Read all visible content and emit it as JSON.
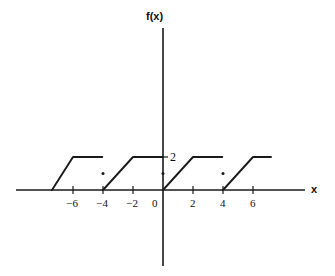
{
  "figure": {
    "background_color": "#ffffff",
    "ink_color": "#1a1a1a"
  },
  "axes": {
    "x_axis_label": "x",
    "y_axis_label": "f(x)",
    "y_value_label": "2",
    "x_tick_labels": [
      "−6",
      "−4",
      "−2",
      "0",
      "2",
      "4",
      "6"
    ],
    "x_tick_values": [
      -6,
      -4,
      -2,
      0,
      2,
      4,
      6
    ],
    "origin_label": "0"
  },
  "chart_data": {
    "type": "line",
    "title": "",
    "xlabel": "x",
    "ylabel": "f(x)",
    "xlim": [
      -7.6,
      7.8
    ],
    "ylim": [
      -1.4,
      5.4
    ],
    "grid": false,
    "legend": null,
    "x_ticks": [
      -6,
      -4,
      -2,
      0,
      2,
      4,
      6
    ],
    "x_tick_labels": [
      "−6",
      "−4",
      "−2",
      "0",
      "2",
      "4",
      "6"
    ],
    "y_ticks": [
      2
    ],
    "y_tick_labels": [
      "2"
    ],
    "period": 4,
    "plateau_value": 2,
    "series": [
      {
        "name": "f(x) branch -8 to -4",
        "points": [
          [
            -7.4,
            0
          ],
          [
            -6.0,
            2
          ],
          [
            -4.05,
            2
          ]
        ]
      },
      {
        "name": "f(x) branch -4 to 0",
        "points": [
          [
            -4.0,
            0
          ],
          [
            -2.0,
            2
          ],
          [
            0.0,
            2
          ]
        ]
      },
      {
        "name": "f(x) branch 0 to 4",
        "points": [
          [
            0.0,
            0
          ],
          [
            2.0,
            2
          ],
          [
            3.95,
            2
          ]
        ]
      },
      {
        "name": "f(x) branch 4 to 8",
        "points": [
          [
            4.0,
            0
          ],
          [
            6.0,
            2
          ],
          [
            7.2,
            2
          ]
        ]
      }
    ],
    "markers": [
      {
        "name": "dot-left",
        "x": -4.0,
        "y": 1.0
      },
      {
        "name": "dot-origin",
        "x": 0.0,
        "y": 1.0
      },
      {
        "name": "dot-right",
        "x": 4.0,
        "y": 1.0
      }
    ]
  }
}
